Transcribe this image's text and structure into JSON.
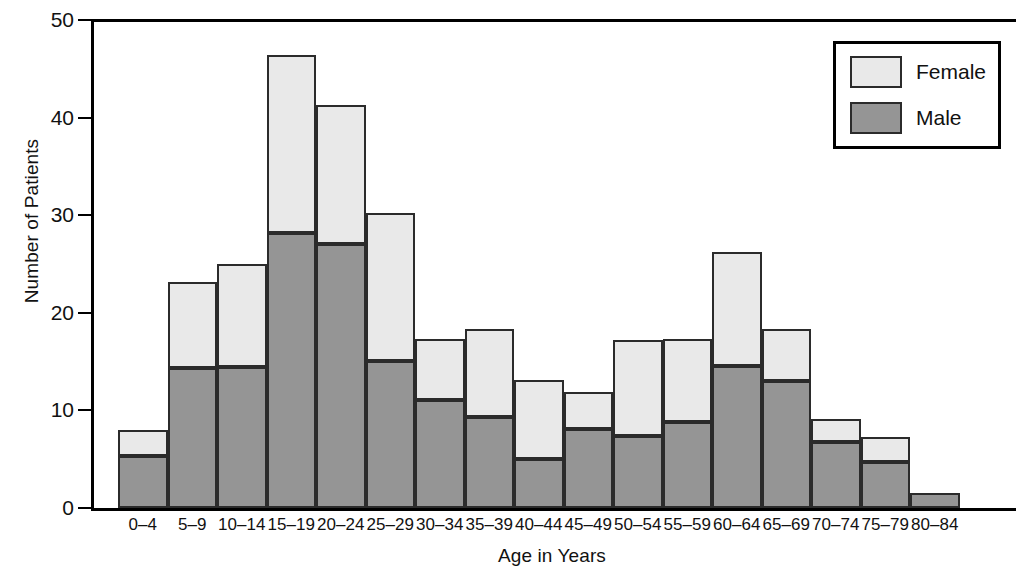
{
  "chart_data": {
    "type": "bar",
    "subtype": "stacked-histogram",
    "title": "",
    "xlabel": "Age in Years",
    "ylabel": "Number of Patients",
    "categories": [
      "0–4",
      "5–9",
      "10–14",
      "15–19",
      "20–24",
      "25–29",
      "30–34",
      "35–39",
      "40–44",
      "45–49",
      "50–54",
      "55–59",
      "60–64",
      "65–69",
      "70–74",
      "75–79",
      "80–84"
    ],
    "series": [
      {
        "name": "Male",
        "color": "#959595",
        "values": [
          5.3,
          14.3,
          14.4,
          28.2,
          27.1,
          15.1,
          11.1,
          9.3,
          5.0,
          8.1,
          7.4,
          8.8,
          14.5,
          13.0,
          6.8,
          4.7,
          1.5
        ]
      },
      {
        "name": "Female",
        "color": "#e9e9e9",
        "values": [
          2.7,
          8.9,
          10.6,
          18.2,
          14.2,
          15.1,
          6.2,
          9.0,
          8.1,
          3.8,
          9.8,
          8.5,
          11.7,
          5.3,
          2.3,
          2.6,
          0.0
        ]
      }
    ],
    "totals": [
      8.0,
      23.2,
      25.0,
      46.4,
      41.3,
      30.2,
      17.3,
      18.3,
      13.1,
      11.9,
      17.2,
      17.3,
      26.2,
      18.3,
      9.1,
      7.3,
      1.5
    ],
    "ylim": [
      0,
      50
    ],
    "yticks": [
      0,
      10,
      20,
      30,
      40,
      50
    ],
    "ytick_labels": [
      "0",
      "10",
      "20",
      "30",
      "40",
      "50"
    ],
    "grid": false,
    "legend_position": "top-right",
    "legend_entries": [
      "Female",
      "Male"
    ]
  },
  "legend": {
    "female_label": "Female",
    "male_label": "Male"
  },
  "axes": {
    "y_title": "Number of Patients",
    "x_title": "Age in Years"
  },
  "colors": {
    "female_fill": "#e9e9e9",
    "male_fill": "#959595",
    "outline": "#2b2b2b",
    "axis": "#000000",
    "background": "#ffffff"
  }
}
